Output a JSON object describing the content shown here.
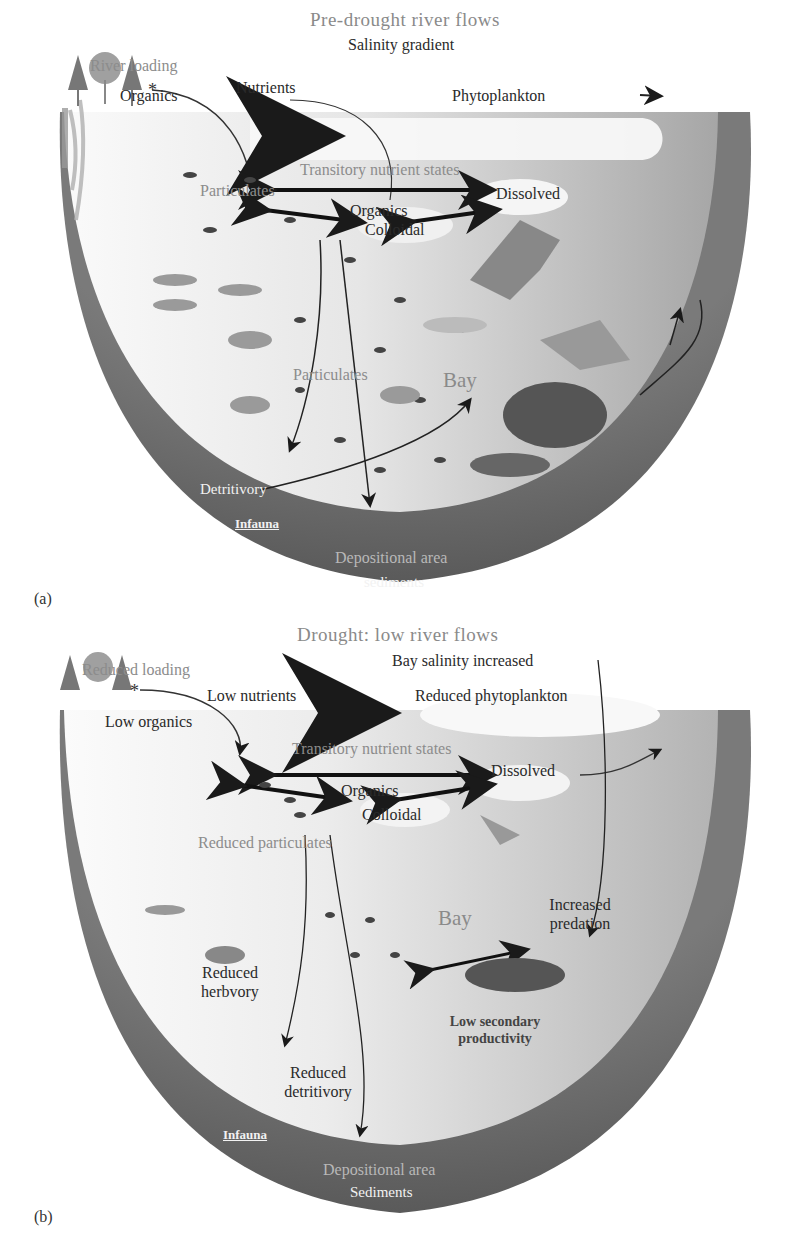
{
  "figure": {
    "panels": [
      {
        "id": "a",
        "panel_label": "(a)",
        "title": "Pre-drought river flows",
        "labels": {
          "river_loading": "River loading",
          "salinity": "Salinity gradient",
          "organics_left": "Organics",
          "nutrients": "Nutrients",
          "phytoplankton": "Phytoplankton",
          "transitory": "Transitory nutrient states",
          "particulates_top": "Particulates",
          "dissolved": "Dissolved",
          "organics_center": "Organics",
          "colloidal": "Colloidal",
          "particulates_mid": "Particulates",
          "bay": "Bay",
          "detritivory": "Detritivory",
          "infauna": "Infauna",
          "depositional": "Depositional area",
          "sediments": "sediments"
        }
      },
      {
        "id": "b",
        "panel_label": "(b)",
        "title": "Drought: low river flows",
        "labels": {
          "river_loading": "Reduced loading",
          "salinity": "Bay salinity increased",
          "organics_left": "Low organics",
          "nutrients": "Low nutrients",
          "phytoplankton": "Reduced phytoplankton",
          "transitory": "Transitory nutrient states",
          "dissolved": "Dissolved",
          "organics_center": "Organics",
          "colloidal": "Colloidal",
          "particulates_mid": "Reduced particulates",
          "bay": "Bay",
          "predation_1": "Increased",
          "predation_2": "predation",
          "herbivory_1": "Reduced",
          "herbivory_2": "herbvory",
          "secondary_1": "Low secondary",
          "secondary_2": "productivity",
          "detritivory_1": "Reduced",
          "detritivory_2": "detritivory",
          "infauna": "Infauna",
          "depositional": "Depositional area",
          "sediments": "Sediments"
        }
      }
    ]
  },
  "colors": {
    "sediment": "#6e6e6e",
    "water_light": "#f4f4f4",
    "water_dark": "#a9a9a9",
    "arrow": "#1a1a1a",
    "bubble": "#f7f7f7"
  }
}
